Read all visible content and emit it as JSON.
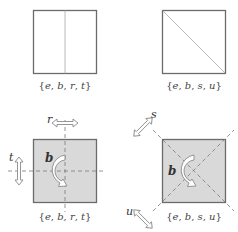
{
  "colors": {
    "outline": "#6b6b6b",
    "thin_line": "#a8a8a8",
    "dashed_line": "#7a7a7a",
    "fill_shaded": "#d9d9d9",
    "arrow_fill": "#ffffff",
    "arrow_stroke": "#8a8a8a"
  },
  "panels": [
    {
      "id": "top-left",
      "shaded": false,
      "divider": "vertical",
      "set_label": {
        "open": "{",
        "items": [
          "e",
          "b",
          "r",
          "t"
        ],
        "close": "}"
      }
    },
    {
      "id": "top-right",
      "shaded": false,
      "divider": "diagonal",
      "set_label": {
        "open": "{",
        "items": [
          "e",
          "b",
          "s",
          "u"
        ],
        "close": "}"
      }
    },
    {
      "id": "bottom-left",
      "shaded": true,
      "axes": "horizontal-vertical",
      "rotation_label": "b",
      "reflection_labels": {
        "horizontal": "r",
        "vertical": "t"
      },
      "set_label": {
        "open": "{",
        "items": [
          "e",
          "b",
          "r",
          "t"
        ],
        "close": "}"
      }
    },
    {
      "id": "bottom-right",
      "shaded": true,
      "axes": "diagonals",
      "rotation_label": "b",
      "reflection_labels": {
        "diagonal_up": "s",
        "diagonal_down": "u"
      },
      "set_label": {
        "open": "{",
        "items": [
          "e",
          "b",
          "s",
          "u"
        ],
        "close": "}"
      }
    }
  ]
}
